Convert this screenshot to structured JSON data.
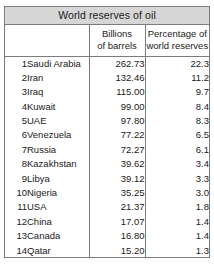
{
  "table": {
    "title": "World reserves of oil",
    "columns": {
      "rank_header": "",
      "country_header": "",
      "billions_header_line1": "Billions",
      "billions_header_line2": "of barrels",
      "percentage_header_line1": "Percentage of",
      "percentage_header_line2": "world reserves"
    },
    "rows": [
      {
        "rank": "1",
        "country": "Saudi Arabia",
        "billions_of_barrels": "262.73",
        "percentage_of_world_reserves": "22.3"
      },
      {
        "rank": "2",
        "country": "Iran",
        "billions_of_barrels": "132.46",
        "percentage_of_world_reserves": "11.2"
      },
      {
        "rank": "3",
        "country": "Iraq",
        "billions_of_barrels": "115.00",
        "percentage_of_world_reserves": "9.7"
      },
      {
        "rank": "4",
        "country": "Kuwait",
        "billions_of_barrels": "99.00",
        "percentage_of_world_reserves": "8.4"
      },
      {
        "rank": "5",
        "country": "UAE",
        "billions_of_barrels": "97.80",
        "percentage_of_world_reserves": "8.3"
      },
      {
        "rank": "6",
        "country": "Venezuela",
        "billions_of_barrels": "77.22",
        "percentage_of_world_reserves": "6.5"
      },
      {
        "rank": "7",
        "country": "Russia",
        "billions_of_barrels": "72.27",
        "percentage_of_world_reserves": "6.1"
      },
      {
        "rank": "8",
        "country": "Kazakhstan",
        "billions_of_barrels": "39.62",
        "percentage_of_world_reserves": "3.4"
      },
      {
        "rank": "9",
        "country": "Libya",
        "billions_of_barrels": "39.12",
        "percentage_of_world_reserves": "3.3"
      },
      {
        "rank": "10",
        "country": "Nigeria",
        "billions_of_barrels": "35.25",
        "percentage_of_world_reserves": "3.0"
      },
      {
        "rank": "11",
        "country": "USA",
        "billions_of_barrels": "21.37",
        "percentage_of_world_reserves": "1.8"
      },
      {
        "rank": "12",
        "country": "China",
        "billions_of_barrels": "17.07",
        "percentage_of_world_reserves": "1.4"
      },
      {
        "rank": "13",
        "country": "Canada",
        "billions_of_barrels": "16.80",
        "percentage_of_world_reserves": "1.4"
      },
      {
        "rank": "14",
        "country": "Qatar",
        "billions_of_barrels": "15.20",
        "percentage_of_world_reserves": "1.3"
      }
    ]
  },
  "colors": {
    "title_background": "#d6d6d6",
    "border": "#7c7c7c",
    "text": "#1a1a1a",
    "page_background": "#ffffff"
  }
}
